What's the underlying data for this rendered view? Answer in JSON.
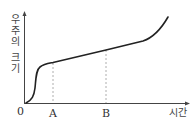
{
  "diagram": {
    "y_axis_label_chars": [
      "우",
      "주",
      "의",
      "",
      "크",
      "기"
    ],
    "y_axis_label": "우주의 크기",
    "x_axis_label": "시간",
    "origin_label": "0",
    "markers": [
      {
        "label": "A"
      },
      {
        "label": "B"
      }
    ],
    "colors": {
      "curve": "#222222",
      "axis": "#444444",
      "dashed": "#999999"
    }
  }
}
